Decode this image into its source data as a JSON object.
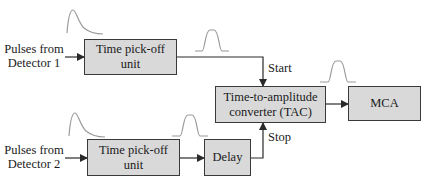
{
  "diagram": {
    "type": "block-diagram",
    "title": "",
    "colors": {
      "box_fill": "#d9d9d9",
      "box_border": "#3a3a3a",
      "line": "#2a2a2a",
      "pulse": "#9a9a9a",
      "text": "#1a1a1a"
    },
    "inputs": [
      {
        "id": "det1",
        "line1": "Pulses from",
        "line2": "Detector 1"
      },
      {
        "id": "det2",
        "line1": "Pulses from",
        "line2": "Detector 2"
      }
    ],
    "blocks": [
      {
        "id": "tpo1",
        "line1": "Time pick-off",
        "line2": "unit"
      },
      {
        "id": "tpo2",
        "line1": "Time pick-off",
        "line2": "unit"
      },
      {
        "id": "delay",
        "line1": "Delay"
      },
      {
        "id": "tac",
        "line1": "Time-to-amplitude",
        "line2": "converter (TAC)"
      },
      {
        "id": "mca",
        "line1": "MCA"
      }
    ],
    "signal_labels": {
      "start": "Start",
      "stop": "Stop"
    },
    "connections": [
      {
        "from": "det1",
        "to": "tpo1"
      },
      {
        "from": "tpo1",
        "to": "tac",
        "label": "Start"
      },
      {
        "from": "det2",
        "to": "tpo2"
      },
      {
        "from": "tpo2",
        "to": "delay"
      },
      {
        "from": "delay",
        "to": "tac",
        "label": "Stop"
      },
      {
        "from": "tac",
        "to": "mca"
      }
    ],
    "pulse_shapes": [
      {
        "position": "above-tpo1-input",
        "shape": "exponential-decay"
      },
      {
        "position": "tpo1-output",
        "shape": "square-ish"
      },
      {
        "position": "above-tpo2-input",
        "shape": "exponential-decay"
      },
      {
        "position": "tpo2-output",
        "shape": "square-ish"
      },
      {
        "position": "tac-output",
        "shape": "square-ish"
      }
    ]
  }
}
